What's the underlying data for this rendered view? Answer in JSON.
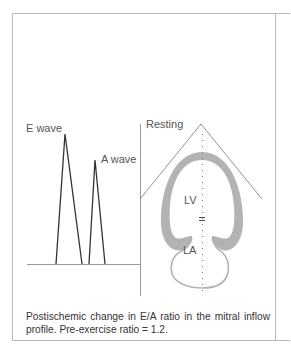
{
  "figure": {
    "labels": {
      "e_wave": "E wave",
      "a_wave": "A wave",
      "resting": "Resting",
      "lv": "LV",
      "la": "LA"
    },
    "caption": "Postischemic change in E/A ratio in the mitral inflow profile. Pre-exercise ratio = 1.2.",
    "colors": {
      "frame": "#b5b5b5",
      "wave_line": "#333333",
      "heart_wall": "#b0b0b0",
      "text": "#555555"
    }
  }
}
